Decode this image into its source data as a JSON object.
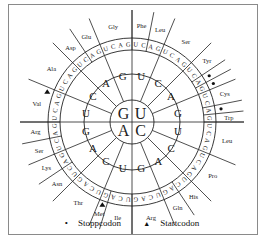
{
  "diagram": {
    "title": "",
    "center": {
      "x": 132,
      "y": 122
    },
    "radii": {
      "inner": 22,
      "second": 48,
      "third": 72,
      "letters": 84,
      "outer": 112
    },
    "first_bases": [
      {
        "base": "U",
        "start": 0,
        "end": 90
      },
      {
        "base": "C",
        "start": 90,
        "end": 180
      },
      {
        "base": "A",
        "start": 180,
        "end": 270
      },
      {
        "base": "G",
        "start": 270,
        "end": 360
      }
    ],
    "second_bases_per_quadrant": [
      "U",
      "C",
      "A",
      "G"
    ],
    "third_bases": [
      "U",
      "C",
      "A",
      "G"
    ],
    "amino_acids": [
      {
        "name": "Phe",
        "codons": [
          "UUU",
          "UUC"
        ]
      },
      {
        "name": "Leu",
        "codons": [
          "UUA",
          "UUG"
        ]
      },
      {
        "name": "Ser",
        "codons": [
          "UCU",
          "UCC",
          "UCA",
          "UCG"
        ]
      },
      {
        "name": "Tyr",
        "codons": [
          "UAU",
          "UAC"
        ]
      },
      {
        "name": "",
        "codons": [
          "UAA"
        ],
        "stop": true
      },
      {
        "name": "",
        "codons": [
          "UAG"
        ],
        "stop": true
      },
      {
        "name": "Cys",
        "codons": [
          "UGU",
          "UGC"
        ]
      },
      {
        "name": "",
        "codons": [
          "UGA"
        ],
        "stop": true
      },
      {
        "name": "Trp",
        "codons": [
          "UGG"
        ]
      },
      {
        "name": "Leu",
        "codons": [
          "CUU",
          "CUC",
          "CUA",
          "CUG"
        ]
      },
      {
        "name": "Pro",
        "codons": [
          "CCU",
          "CCC",
          "CCA",
          "CCG"
        ]
      },
      {
        "name": "His",
        "codons": [
          "CAU",
          "CAC"
        ]
      },
      {
        "name": "Gln",
        "codons": [
          "CAA",
          "CAG"
        ]
      },
      {
        "name": "Arg",
        "codons": [
          "CGU",
          "CGC",
          "CGA",
          "CGG"
        ]
      },
      {
        "name": "Ile",
        "codons": [
          "AUU",
          "AUC",
          "AUA"
        ]
      },
      {
        "name": "Met",
        "codons": [
          "AUG"
        ],
        "start": true
      },
      {
        "name": "Thr",
        "codons": [
          "ACU",
          "ACC",
          "ACA",
          "ACG"
        ]
      },
      {
        "name": "Asn",
        "codons": [
          "AAU",
          "AAC"
        ]
      },
      {
        "name": "Lys",
        "codons": [
          "AAA",
          "AAG"
        ]
      },
      {
        "name": "Ser",
        "codons": [
          "AGU",
          "AGC"
        ]
      },
      {
        "name": "Arg",
        "codons": [
          "AGA",
          "AGG"
        ]
      },
      {
        "name": "Val",
        "codons": [
          "GUU",
          "GUC",
          "GUA",
          "GUG"
        ],
        "start_marker": true
      },
      {
        "name": "Ala",
        "codons": [
          "GCU",
          "GCC",
          "GCA",
          "GCG"
        ]
      },
      {
        "name": "Asp",
        "codons": [
          "GAU",
          "GAC"
        ]
      },
      {
        "name": "Glu",
        "codons": [
          "GAA",
          "GAG"
        ]
      },
      {
        "name": "Gly",
        "codons": [
          "GGU",
          "GGC",
          "GGA",
          "GGG"
        ]
      }
    ]
  },
  "legend": {
    "stop_symbol": "•",
    "stop_label": "Stoppcodon",
    "start_symbol": "▲",
    "start_label": "Startcodon"
  }
}
